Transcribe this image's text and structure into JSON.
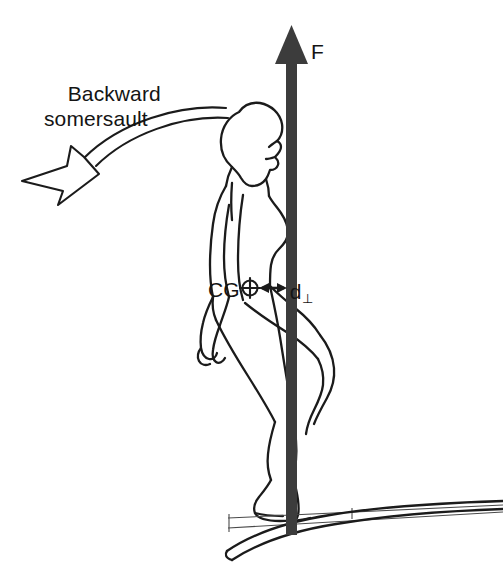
{
  "diagram": {
    "background_color": "#ffffff",
    "ink_color": "#141414",
    "force_arrow_color": "#3c3c3c",
    "labels": {
      "somersault_line1": "Backward",
      "somersault_line2": "somersault",
      "force": "F",
      "center_of_gravity": "CG",
      "perpendicular_distance": "d",
      "perpendicular_distance_subscript": "⊥"
    },
    "annotations": [
      {
        "name": "rotation-direction-arrow",
        "description": "Curved open outline arrow sweeping from behind the head leftward and downward, indicating backward rotation",
        "style": "outlined-curved-arrow",
        "direction": "counter-clockwise"
      },
      {
        "name": "ground-reaction-force-arrow",
        "description": "Thick solid vertical arrow from the beam upward past the head",
        "style": "solid-block-arrow",
        "direction": "up",
        "color": "#3c3c3c"
      },
      {
        "name": "moment-arm-arrow",
        "description": "Short horizontal double-headed arrow between the centre of gravity marker and the vertical force line",
        "style": "double-headed-arrow"
      },
      {
        "name": "cg-marker",
        "description": "Small circle with crosshair marking the centre of gravity"
      },
      {
        "name": "gymnast-figure",
        "description": "Line-drawn profile outline of a gymnast standing on one leg facing right, other knee lifted"
      },
      {
        "name": "beam",
        "description": "Curved flexing beam / springboard under the gymnast's foot with thin horizontal reference lines"
      }
    ]
  }
}
